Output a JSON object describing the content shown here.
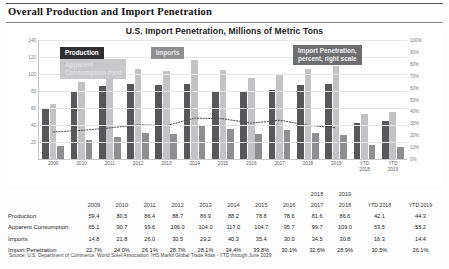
{
  "document": {
    "title": "Overall Production and Import Penetration",
    "source_note": "Source: U.S. Department of Commerce, World Steel Association, IHS Markit Global Trade Atlas -  YTD through June 2019"
  },
  "chart_data": {
    "type": "bar",
    "title": "U.S. Import Penetration, Millions of Metric Tons",
    "xlabel": "",
    "ylabel": "",
    "ylim": [
      0,
      140
    ],
    "y2lim": [
      0,
      1
    ],
    "grid": true,
    "legend_position": "inside-top",
    "categories": [
      "2009",
      "2010",
      "2011",
      "2012",
      "2013",
      "2014",
      "2015",
      "2016",
      "2017",
      "2018",
      "2019",
      "YTD\n2018",
      "YTD\n2019"
    ],
    "category_labels": [
      "2009",
      "2010",
      "2011",
      "2012",
      "2013",
      "2014",
      "2015",
      "2016",
      "2017",
      "2018",
      "2019",
      "YTD 2018",
      "YTD 2019"
    ],
    "yticks": [
      "140",
      "120",
      "100",
      "80",
      "60",
      "40",
      "20"
    ],
    "y2ticks": [
      "100%",
      "90%",
      "80%",
      "70%",
      "60%",
      "50%",
      "40%",
      "30%",
      "20%",
      "10%",
      "0%"
    ],
    "series": [
      {
        "name": "Production",
        "axis": "left",
        "color": "#58585a",
        "values": [
          59.4,
          80.5,
          86.4,
          88.7,
          86.9,
          88.2,
          78.8,
          78.6,
          81.6,
          86.6,
          87.8,
          42.1,
          44.3
        ]
      },
      {
        "name": "Apparent Consumption mmt",
        "axis": "left",
        "color": "#c3c3c5",
        "values": [
          65.1,
          90.7,
          99.6,
          106.0,
          104.0,
          117.0,
          104.7,
          95.7,
          99.7,
          106.1,
          109.0,
          53.5,
          55.2
        ]
      },
      {
        "name": "Imports",
        "axis": "left",
        "color": "#8f8f92",
        "values": [
          14.8,
          21.8,
          26.0,
          30.5,
          29.2,
          40.3,
          35.4,
          30.0,
          34.5,
          30.8,
          28.4,
          16.3,
          14.4
        ]
      },
      {
        "name": "Import Penetration, percent, right scale",
        "axis": "right",
        "color": "#555555",
        "style": "dotted-line",
        "values": [
          0.227,
          0.24,
          0.261,
          0.287,
          0.281,
          0.344,
          0.338,
          0.301,
          0.326,
          0.283,
          0.261,
          0.305,
          0.261
        ]
      }
    ],
    "legend": [
      {
        "key": "production",
        "label": "Production"
      },
      {
        "key": "imports",
        "label": "Imports"
      },
      {
        "key": "consumption",
        "label": "Apparent\nConsumption mmt"
      },
      {
        "key": "penetration",
        "label": "Import Penetration,\npercent, right scale"
      }
    ]
  },
  "legend_text": {
    "production": "Production",
    "imports": "Imports",
    "consumption_line1": "Apparent",
    "consumption_line2": "Consumption mmt",
    "penetration_line1": "Import Penetration,",
    "penetration_line2": "percent, right scale"
  },
  "table": {
    "header_years": [
      "2009",
      "2010",
      "2011",
      "2012",
      "2013",
      "2014",
      "2015",
      "2016",
      "2017",
      "2018"
    ],
    "header_ytd_top": [
      "2018",
      "2019"
    ],
    "header_ytd": [
      "YTD 2018",
      "YTD 2019"
    ],
    "rows": [
      {
        "label": "Production",
        "values": [
          "59.4",
          "80.5",
          "86.4",
          "88.7",
          "86.9",
          "88.2",
          "78.8",
          "78.6",
          "81.6",
          "86.6"
        ],
        "ytd": [
          "42.1",
          "44.3"
        ]
      },
      {
        "label": "Apparent Consumption",
        "values": [
          "65.1",
          "90.7",
          "99.6",
          "106.0",
          "104.0",
          "117.0",
          "104.7",
          "95.7",
          "99.7",
          "109.0"
        ],
        "ytd": [
          "53.5",
          "55.2"
        ]
      },
      {
        "label": "Imports",
        "values": [
          "14.8",
          "21.8",
          "26.0",
          "30.5",
          "29.2",
          "40.3",
          "35.4",
          "30.0",
          "34.5",
          "30.8"
        ],
        "ytd": [
          "16.3",
          "14.4"
        ]
      },
      {
        "label": "Import Penetration",
        "values": [
          "22.7%",
          "24.0%",
          "26.1%",
          "28.7%",
          "28.1%",
          "34.4%",
          "33.8%",
          "30.1%",
          "32.6%",
          "28.9%"
        ],
        "ytd": [
          "30.5%",
          "26.1%"
        ]
      }
    ]
  }
}
